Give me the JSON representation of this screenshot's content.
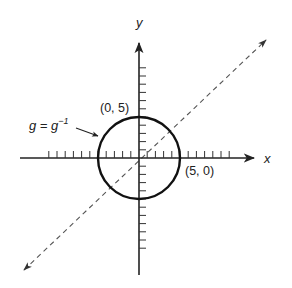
{
  "diagram": {
    "axes": {
      "x_label": "x",
      "y_label": "y"
    },
    "labels": {
      "top_point": "(0, 5)",
      "right_point": "(5, 0)",
      "function_label_base": "g = g",
      "function_label_sup": "−1"
    },
    "circle": {
      "center": [
        0,
        0
      ],
      "radius": 5
    },
    "diagonal": {
      "equation": "y = x",
      "style": "dashed",
      "arrows": "both"
    },
    "colors": {
      "ink": "#222222",
      "dashed": "#555555",
      "background": "#ffffff"
    }
  }
}
